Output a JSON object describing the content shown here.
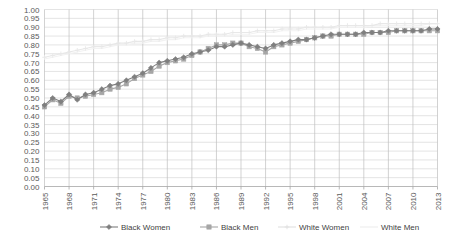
{
  "chart_data": {
    "type": "line",
    "title": "",
    "subtitle": "",
    "xlabel": "",
    "ylabel": "",
    "xlim": [
      1965,
      2013
    ],
    "ylim": [
      0.0,
      1.0
    ],
    "grid": true,
    "legend_position": "bottom",
    "y_ticks": [
      "0.00",
      "0.05",
      "0.10",
      "0.15",
      "0.20",
      "0.25",
      "0.30",
      "0.35",
      "0.40",
      "0.45",
      "0.50",
      "0.55",
      "0.60",
      "0.65",
      "0.70",
      "0.75",
      "0.80",
      "0.85",
      "0.90",
      "0.95",
      "1.00"
    ],
    "x_ticks": [
      "1965",
      "1968",
      "1971",
      "1974",
      "1977",
      "1980",
      "1983",
      "1986",
      "1989",
      "1992",
      "1995",
      "1998",
      "2001",
      "2004",
      "2007",
      "2010",
      "2013"
    ],
    "x": [
      1965,
      1966,
      1967,
      1968,
      1969,
      1970,
      1971,
      1972,
      1973,
      1974,
      1975,
      1976,
      1977,
      1978,
      1979,
      1980,
      1981,
      1982,
      1983,
      1984,
      1985,
      1986,
      1987,
      1988,
      1989,
      1990,
      1991,
      1992,
      1993,
      1994,
      1995,
      1996,
      1997,
      1998,
      1999,
      2000,
      2001,
      2002,
      2003,
      2004,
      2005,
      2006,
      2007,
      2008,
      2009,
      2010,
      2011,
      2012,
      2013
    ],
    "series": [
      {
        "name": "Black Women",
        "color": "#7f7f7f",
        "marker": "diamond",
        "values": [
          0.46,
          0.5,
          0.48,
          0.52,
          0.49,
          0.52,
          0.53,
          0.55,
          0.57,
          0.58,
          0.6,
          0.62,
          0.64,
          0.67,
          0.7,
          0.71,
          0.72,
          0.73,
          0.75,
          0.76,
          0.77,
          0.79,
          0.79,
          0.8,
          0.81,
          0.8,
          0.79,
          0.78,
          0.8,
          0.81,
          0.82,
          0.83,
          0.83,
          0.84,
          0.85,
          0.86,
          0.86,
          0.86,
          0.86,
          0.87,
          0.87,
          0.87,
          0.88,
          0.88,
          0.88,
          0.88,
          0.88,
          0.89,
          0.89
        ]
      },
      {
        "name": "Black Men",
        "color": "#a6a6a6",
        "marker": "square",
        "values": [
          0.45,
          0.49,
          0.47,
          0.51,
          0.5,
          0.51,
          0.52,
          0.53,
          0.55,
          0.56,
          0.58,
          0.61,
          0.63,
          0.65,
          0.68,
          0.7,
          0.71,
          0.72,
          0.74,
          0.76,
          0.78,
          0.8,
          0.8,
          0.81,
          0.81,
          0.79,
          0.78,
          0.76,
          0.79,
          0.8,
          0.81,
          0.82,
          0.83,
          0.84,
          0.85,
          0.85,
          0.86,
          0.86,
          0.86,
          0.86,
          0.87,
          0.87,
          0.87,
          0.88,
          0.88,
          0.88,
          0.88,
          0.88,
          0.88
        ]
      },
      {
        "name": "White Women",
        "color": "#e8e8e8",
        "marker": "plus",
        "values": [
          0.73,
          0.74,
          0.75,
          0.76,
          0.77,
          0.78,
          0.79,
          0.79,
          0.8,
          0.81,
          0.81,
          0.82,
          0.82,
          0.83,
          0.83,
          0.84,
          0.84,
          0.85,
          0.85,
          0.85,
          0.86,
          0.86,
          0.86,
          0.87,
          0.87,
          0.87,
          0.88,
          0.88,
          0.88,
          0.89,
          0.89,
          0.89,
          0.9,
          0.9,
          0.9,
          0.9,
          0.91,
          0.91,
          0.91,
          0.91,
          0.91,
          0.92,
          0.92,
          0.92,
          0.92,
          0.92,
          0.92,
          0.92,
          0.92
        ]
      },
      {
        "name": "White Men",
        "color": "#f2f2f2",
        "marker": "none",
        "values": [
          0.72,
          0.73,
          0.74,
          0.75,
          0.76,
          0.77,
          0.78,
          0.78,
          0.79,
          0.8,
          0.8,
          0.81,
          0.81,
          0.82,
          0.82,
          0.83,
          0.83,
          0.84,
          0.84,
          0.84,
          0.85,
          0.85,
          0.85,
          0.86,
          0.86,
          0.86,
          0.87,
          0.87,
          0.87,
          0.88,
          0.88,
          0.88,
          0.89,
          0.89,
          0.89,
          0.89,
          0.9,
          0.9,
          0.9,
          0.9,
          0.91,
          0.91,
          0.91,
          0.91,
          0.91,
          0.91,
          0.91,
          0.92,
          0.92
        ]
      }
    ],
    "legend": [
      {
        "label": "Black Women",
        "color": "#7f7f7f",
        "marker": "diamond"
      },
      {
        "label": "Black Men",
        "color": "#a6a6a6",
        "marker": "square"
      },
      {
        "label": "White Women",
        "color": "#e0e0e0",
        "marker": "plus"
      },
      {
        "label": "White Men",
        "color": "#ededed",
        "marker": "none"
      }
    ]
  }
}
